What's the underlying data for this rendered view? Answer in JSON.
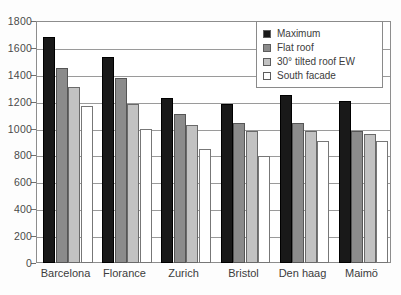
{
  "chart_data": {
    "type": "bar",
    "title": "",
    "subtitle": "",
    "xlabel": "",
    "ylabel": "",
    "ylim": [
      0,
      1800
    ],
    "ytick_step": 200,
    "yticks": [
      0,
      200,
      400,
      600,
      800,
      1000,
      1200,
      1400,
      1600,
      1800
    ],
    "grid": true,
    "legend_position": "top-right",
    "categories": [
      "Barcelona",
      "Florance",
      "Zurich",
      "Bristol",
      "Den haag",
      "Maimö"
    ],
    "series": [
      {
        "name": "Maximum",
        "color": "#191919",
        "values": [
          1680,
          1535,
          1230,
          1185,
          1250,
          1205
        ]
      },
      {
        "name": "Flat roof",
        "color": "#8b8b8b",
        "values": [
          1450,
          1375,
          1105,
          1045,
          1045,
          980
        ]
      },
      {
        "name": "30° tilted roof EW",
        "color": "#c2c2c2",
        "values": [
          1310,
          1180,
          1030,
          980,
          985,
          960
        ]
      },
      {
        "name": "South facade",
        "color": "#ffffff",
        "values": [
          1165,
          1000,
          845,
          795,
          905,
          905
        ]
      }
    ]
  },
  "legend": {
    "items": [
      {
        "label": "Maximum",
        "swatch": "#191919"
      },
      {
        "label": "Flat roof",
        "swatch": "#8b8b8b"
      },
      {
        "label": "30° tilted roof EW",
        "swatch": "#c2c2c2"
      },
      {
        "label": "South facade",
        "swatch": "#ffffff"
      }
    ]
  }
}
